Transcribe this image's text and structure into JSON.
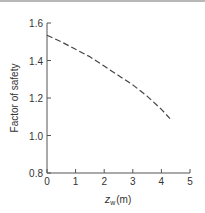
{
  "chart_data": {
    "type": "line",
    "title": "",
    "xlabel": "z_w (m)",
    "xlabel_main": "z",
    "xlabel_sub": "w",
    "xlabel_unit": "(m)",
    "ylabel": "Factor of safety",
    "xlim": [
      0,
      5
    ],
    "ylim": [
      0.8,
      1.6
    ],
    "xticks": [
      "0",
      "1",
      "2",
      "3",
      "4",
      "5"
    ],
    "yticks": [
      "0.8",
      "1.0",
      "1.2",
      "1.4",
      "1.6"
    ],
    "grid": false,
    "legend": null,
    "series": [
      {
        "name": "Factor of safety",
        "style": "dashed",
        "color": "#444444",
        "x": [
          0,
          0.5,
          1,
          1.5,
          2,
          2.5,
          3,
          3.5,
          4,
          4.3
        ],
        "y": [
          1.535,
          1.5,
          1.46,
          1.42,
          1.37,
          1.32,
          1.27,
          1.21,
          1.14,
          1.09
        ]
      }
    ]
  }
}
